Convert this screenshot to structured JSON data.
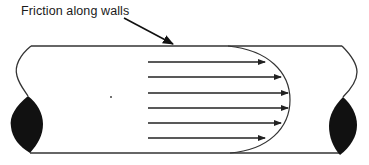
{
  "diagram": {
    "label": "Friction along walls",
    "pointer": {
      "from": [
        124,
        18
      ],
      "to": [
        173,
        45
      ]
    },
    "pipe": {
      "top_y": 46,
      "bottom_y": 153,
      "left_x": 31,
      "right_x": 342,
      "stroke": "#333333"
    },
    "velocity_profile": {
      "shape": "parabolic",
      "arrow_start_x": 148,
      "arrows": [
        {
          "y": 62,
          "end_x": 265
        },
        {
          "y": 77,
          "end_x": 281
        },
        {
          "y": 93,
          "end_x": 288
        },
        {
          "y": 108,
          "end_x": 288
        },
        {
          "y": 123,
          "end_x": 281
        },
        {
          "y": 138,
          "end_x": 265
        }
      ],
      "curve_apex_x": 290
    },
    "seals": {
      "fill": "#111111",
      "count": 2
    }
  }
}
